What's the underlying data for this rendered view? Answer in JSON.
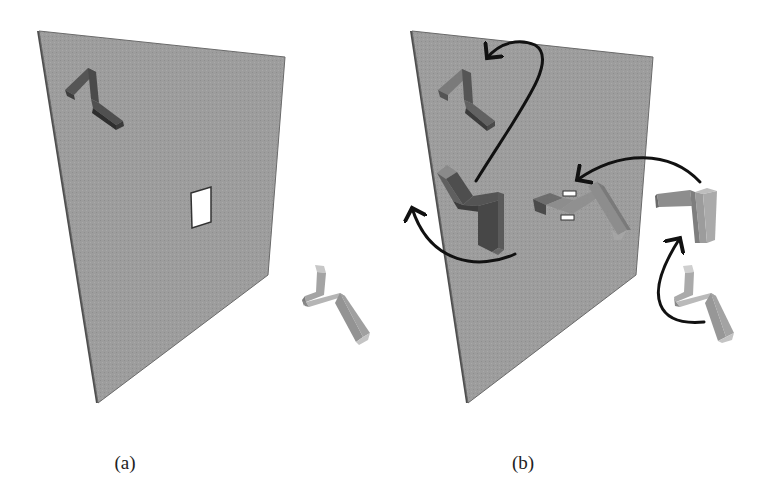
{
  "figure": {
    "panels": [
      {
        "id": "a",
        "caption": "(a)",
        "description": "Wall with rectangular hole; Z-shaped block embedded in wall (upper-left) and a free Z-shaped block outside the wall (lower-right)",
        "wall": {
          "corners": [
            [
              37,
              31
            ],
            [
              285,
              57
            ],
            [
              268,
              275
            ],
            [
              96,
              403
            ]
          ],
          "color": "#9b9b9b",
          "edge_color": "#555555"
        },
        "hole": {
          "corners": [
            [
              191,
              193
            ],
            [
              211,
              188
            ],
            [
              211,
              222
            ],
            [
              192,
              228
            ]
          ],
          "color": "#ffffff"
        },
        "pieces": [
          {
            "name": "embedded-piece",
            "shade": "dark",
            "color": "#5a5a5a"
          },
          {
            "name": "free-piece",
            "shade": "light",
            "color": "#a8a8a8"
          }
        ]
      },
      {
        "id": "b",
        "caption": "(b)",
        "description": "Sequence of rotations/translations of the block, shown with curved black arrows, to pass it through the hole in the wall",
        "wall": {
          "corners": [
            [
              410,
              31
            ],
            [
              653,
              57
            ],
            [
              636,
              275
            ],
            [
              466,
              403
            ]
          ],
          "color": "#9b9b9b",
          "edge_color": "#555555"
        },
        "pieces": [
          {
            "name": "piece-top-left",
            "shade": "dark",
            "color": "#666666"
          },
          {
            "name": "piece-mid-left",
            "shade": "dark",
            "color": "#5e5e5e"
          },
          {
            "name": "piece-in-hole",
            "shade": "medium",
            "color": "#7f7f7f"
          },
          {
            "name": "piece-right-rotated",
            "shade": "light",
            "color": "#999999"
          },
          {
            "name": "piece-bottom-right",
            "shade": "light",
            "color": "#aaaaaa"
          }
        ],
        "arrows": [
          {
            "name": "arrow-bottom-right-to-right",
            "color": "#111111"
          },
          {
            "name": "arrow-right-to-hole",
            "color": "#111111"
          },
          {
            "name": "arrow-mid-left-curl-left",
            "color": "#111111"
          },
          {
            "name": "arrow-mid-to-top-left",
            "color": "#111111"
          }
        ]
      }
    ]
  }
}
